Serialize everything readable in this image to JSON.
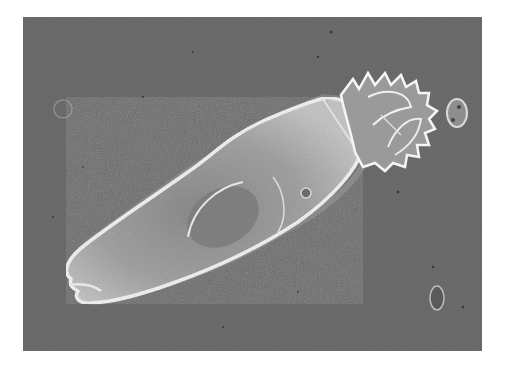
{
  "figure": {
    "colors": {
      "background": "#6f6f6f",
      "body_fill": "#a9a9a9",
      "body_edge": "#f2f2f2",
      "interior": "#8a8a8a",
      "page": "#ffffff"
    }
  }
}
